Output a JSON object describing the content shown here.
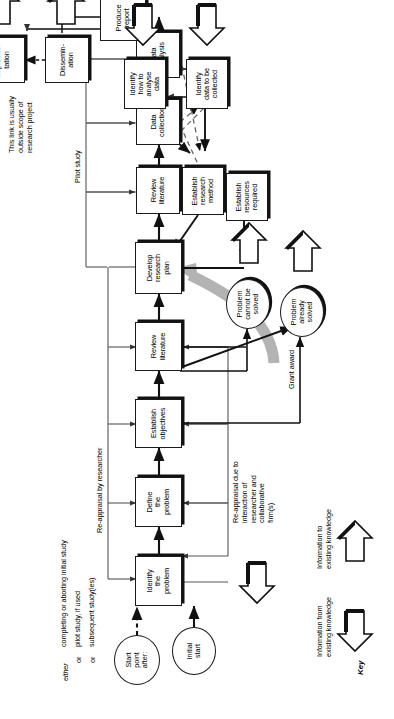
{
  "diagram": {
    "type": "flowchart",
    "orientation": "landscape artwork rotated 90 degrees counter-clockwise on a portrait page"
  },
  "nodes": {
    "initial_start": "Initial\nstart",
    "start_point_after": "Start\npoint\nafter:",
    "identify_problem": "Identify\nthe\nproblem",
    "define_problem": "Define\nthe\nproblem",
    "establish_objectives": "Establish\nobjectives",
    "review_literature_1": "Review\nliterature",
    "develop_research_plan": "Develop\nresearch\nplan",
    "establish_resources": "Establish\nresources\nrequired",
    "establish_research_method": "Establish\nresearch\nmethod",
    "identify_data": "Identify\ndata to be\ncollected",
    "identify_how_analyse": "Identify\nhow to\nanalyse\ndata",
    "review_literature_2": "Review\nliterature",
    "data_collection": "Data\ncollection",
    "data_analysis": "Data\nanalysis",
    "produce_report": "Produce\nreport",
    "dissemination": "Dissemin-\nation",
    "implementation": "Implemen-\ntation",
    "problem_cannot": "Problem\ncannot be\nsolved",
    "problem_already": "Problem\nalready\nsolved"
  },
  "labels": {
    "either": "either",
    "or_1": "or",
    "or_2": "or",
    "branch_1": "completing or aborting initial study",
    "branch_2": "pilot study, if used",
    "branch_3": "subsequent study(ies)",
    "reappraisal_researcher": "Re-appraisal by researcher",
    "reappraisal_interaction": "Re-appraisal due to\ninteraction of\nresearcher and\ncollaborative\nfirm(s)",
    "pilot_study": "Pilot study",
    "grant_award": "Grant award",
    "link_note": "This link is usually\noutside scope of\nresearch project"
  },
  "key": {
    "title": "Key",
    "from_label": "Information from\nexisting knowledge",
    "to_label": "Information to\nexisting knowledge"
  },
  "colors": {
    "ink": "#111111",
    "grant_arrow": "#b3b3b3",
    "paper": "#ffffff"
  }
}
